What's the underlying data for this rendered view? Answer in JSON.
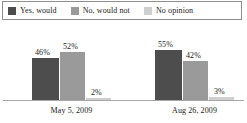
{
  "legend": {
    "items": [
      {
        "label": "Yes, would",
        "color": "#4d4d4d",
        "icon": "legend-swatch-icon"
      },
      {
        "label": "No, would not",
        "color": "#9a9a9a",
        "icon": "legend-swatch-icon"
      },
      {
        "label": "No opinion",
        "color": "#cfcfcf",
        "icon": "legend-swatch-icon"
      }
    ]
  },
  "chart_data": {
    "type": "bar",
    "title": "",
    "xlabel": "",
    "ylabel": "",
    "ylim": [
      0,
      60
    ],
    "grid": false,
    "legend_position": "top",
    "categories": [
      "May 5, 2009",
      "Aug 26, 2009"
    ],
    "series": [
      {
        "name": "Yes, would",
        "color": "#4d4d4d",
        "values": [
          46,
          55
        ],
        "labels": [
          "46%",
          "55%"
        ]
      },
      {
        "name": "No, would not",
        "color": "#9a9a9a",
        "values": [
          52,
          42
        ],
        "labels": [
          "52%",
          "42%"
        ]
      },
      {
        "name": "No opinion",
        "color": "#cfcfcf",
        "values": [
          2,
          3
        ],
        "labels": [
          "2%",
          "3%"
        ]
      }
    ]
  }
}
